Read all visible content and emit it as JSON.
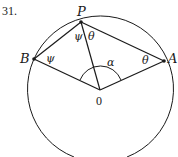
{
  "problem_number": "31.",
  "points": {
    "P": {
      "label": "P"
    },
    "B": {
      "label": "B"
    },
    "A": {
      "label": "A"
    },
    "O": {
      "label": "0"
    }
  },
  "angles": {
    "psi_at_P": "ψ",
    "theta_at_P": "θ",
    "psi_at_B": "ψ",
    "theta_at_A": "θ",
    "alpha_at_O": "α"
  },
  "colors": {
    "stroke": "#1a1a1a",
    "background": "#ffffff"
  }
}
